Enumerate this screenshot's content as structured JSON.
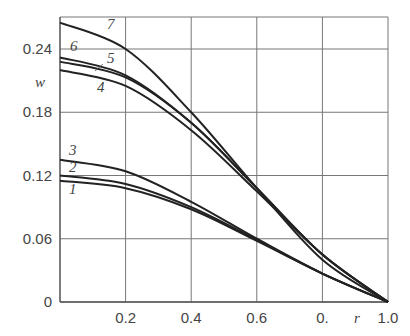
{
  "chart_data": {
    "type": "line",
    "title": "",
    "xlabel": "r",
    "ylabel": "w",
    "xlim": [
      0,
      1.0
    ],
    "ylim": [
      0,
      0.27
    ],
    "x_ticks": [
      "0.2",
      "0.4",
      "0.6",
      "0.",
      "1.0"
    ],
    "y_ticks": [
      "0",
      "0.06",
      "0.12",
      "0.18",
      "0.24"
    ],
    "grid": true,
    "legend": "inline curve numbers",
    "x": [
      0,
      0.2,
      0.4,
      0.6,
      0.8,
      1.0
    ],
    "series": [
      {
        "name": "1",
        "values": [
          0.115,
          0.108,
          0.088,
          0.058,
          0.027,
          0
        ]
      },
      {
        "name": "2",
        "values": [
          0.12,
          0.112,
          0.09,
          0.059,
          0.027,
          0
        ]
      },
      {
        "name": "3",
        "values": [
          0.135,
          0.124,
          0.095,
          0.06,
          0.027,
          0
        ]
      },
      {
        "name": "4",
        "values": [
          0.22,
          0.205,
          0.163,
          0.105,
          0.045,
          0
        ]
      },
      {
        "name": "5",
        "values": [
          0.228,
          0.213,
          0.17,
          0.108,
          0.045,
          0
        ]
      },
      {
        "name": "6",
        "values": [
          0.232,
          0.215,
          0.17,
          0.108,
          0.045,
          0
        ]
      },
      {
        "name": "7",
        "values": [
          0.265,
          0.24,
          0.18,
          0.108,
          0.04,
          0
        ]
      }
    ]
  }
}
